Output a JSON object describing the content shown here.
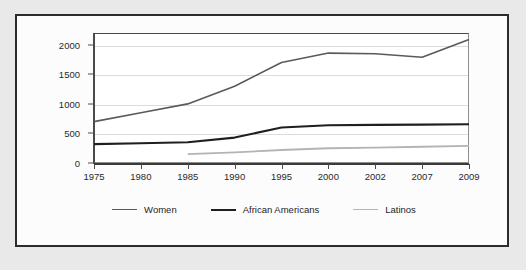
{
  "page": {
    "background_color": "#e9e9e9",
    "top_caption": ""
  },
  "figure": {
    "card_background": "#fcfcfc",
    "border_color": "#2b2b2b"
  },
  "chart_data": {
    "type": "line",
    "title": "",
    "subtitle": "",
    "xlabel": "",
    "ylabel": "",
    "categories": [
      "1975",
      "1980",
      "1985",
      "1990",
      "1995",
      "2000",
      "2002",
      "2007",
      "2009"
    ],
    "x_tick_labels": [
      "1975",
      "1980",
      "1985",
      "1990",
      "1995",
      "2000",
      "2002",
      "2007",
      "2009"
    ],
    "y_tick_labels": [
      "0",
      "500",
      "1000",
      "1500",
      "2000"
    ],
    "y_ticks": [
      0,
      500,
      1000,
      1500,
      2000
    ],
    "ylim": [
      0,
      2200
    ],
    "grid": "horizontal",
    "legend_position": "bottom-center",
    "series": [
      {
        "name": "Women",
        "color": "#5a5a5a",
        "width": 1.6,
        "values": [
          700,
          850,
          1000,
          1300,
          1700,
          1860,
          1850,
          1790,
          2090
        ]
      },
      {
        "name": "African Americans",
        "color": "#1f1f1f",
        "width": 2.1,
        "values": [
          320,
          335,
          350,
          430,
          600,
          640,
          645,
          650,
          655
        ]
      },
      {
        "name": "Latinos",
        "color": "#b4b4b4",
        "width": 1.8,
        "values": [
          null,
          null,
          150,
          180,
          220,
          250,
          260,
          275,
          290
        ]
      }
    ]
  },
  "legend": {
    "items": [
      {
        "label": "Women",
        "color": "#5a5a5a",
        "width": 1.6
      },
      {
        "label": "African Americans",
        "color": "#1f1f1f",
        "width": 2.3
      },
      {
        "label": "Latinos",
        "color": "#b4b4b4",
        "width": 1.8
      }
    ]
  }
}
